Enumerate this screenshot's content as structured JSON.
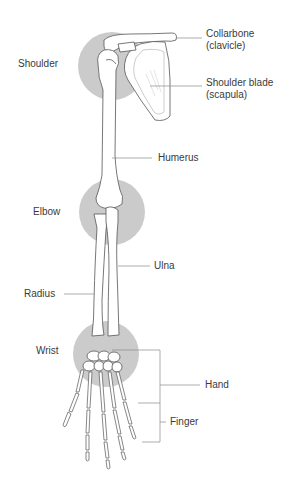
{
  "diagram": {
    "highlight_color": "#c9c9c9",
    "bone_fill": "#ffffff",
    "bone_stroke": "#555555",
    "leader_color": "#888888",
    "labels": {
      "shoulder": "Shoulder",
      "collarbone": "Collarbone",
      "clavicle": "(clavicle)",
      "shoulder_blade": "Shoulder blade",
      "scapula": "(scapula)",
      "humerus": "Humerus",
      "elbow": "Elbow",
      "ulna": "Ulna",
      "radius": "Radius",
      "wrist": "Wrist",
      "hand": "Hand",
      "finger": "Finger"
    },
    "joints": [
      {
        "name": "shoulder",
        "cx": 112,
        "cy": 66,
        "r": 34
      },
      {
        "name": "elbow",
        "cx": 112,
        "cy": 212,
        "r": 33
      },
      {
        "name": "wrist",
        "cx": 106,
        "cy": 354,
        "r": 33
      }
    ]
  }
}
